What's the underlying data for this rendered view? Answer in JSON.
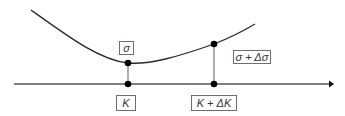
{
  "diagram": {
    "type": "volatility-smile-sensitivity",
    "labels": {
      "sigma": "σ",
      "sigma_plus_delta": "σ + Δσ",
      "strike": "K",
      "strike_plus_delta": "K + ΔK"
    },
    "colors": {
      "curve": "#2a2a2a",
      "axis": "#555555",
      "stem": "#777777",
      "dot": "#000000",
      "box_border": "#6e6e6e",
      "text": "#333333"
    }
  }
}
